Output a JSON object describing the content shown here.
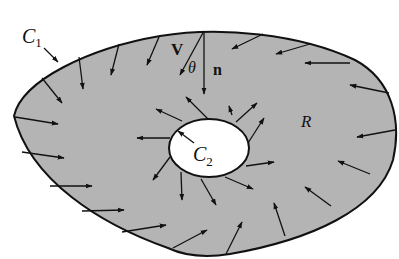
{
  "figure": {
    "type": "vector-field-region-with-hole",
    "colors": {
      "region_fill": "#b4b4b4",
      "hole_fill": "#ffffff",
      "stroke": "#111111",
      "background": "#ffffff"
    },
    "labels": {
      "outer_curve": "C",
      "outer_curve_sub": "1",
      "inner_curve": "C",
      "inner_curve_sub": "2",
      "region": "R",
      "velocity": "V",
      "angle": "θ",
      "normal": "n"
    },
    "arrows": {
      "outer_boundary_direction": "inward",
      "inner_boundary_direction": "outward",
      "outer_count": 17,
      "inner_count": 13
    }
  }
}
